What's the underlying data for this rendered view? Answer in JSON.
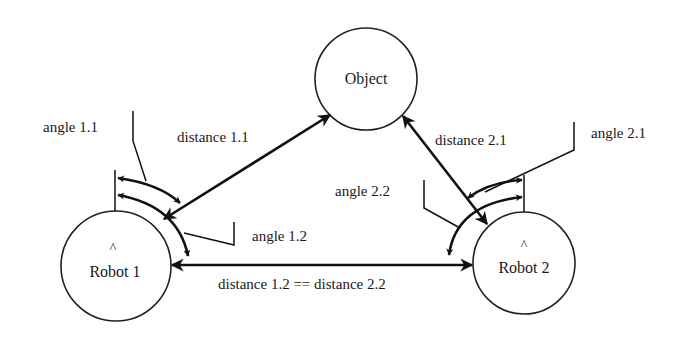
{
  "diagram": {
    "nodes": {
      "object": {
        "label": "Object"
      },
      "robot1": {
        "label": "Robot 1",
        "heading_marker": "^"
      },
      "robot2": {
        "label": "Robot 2",
        "heading_marker": "^"
      }
    },
    "edges": {
      "distance_1_1": {
        "label": "distance 1.1",
        "from": "Robot 1",
        "to": "Object"
      },
      "distance_2_1": {
        "label": "distance 2.1",
        "from": "Robot 2",
        "to": "Object"
      },
      "distance_1_2": {
        "label": "distance 1.2 == distance 2.2",
        "from": "Robot 1",
        "to": "Robot 2"
      }
    },
    "angles": {
      "angle_1_1": {
        "label": "angle 1.1"
      },
      "angle_1_2": {
        "label": "angle 1.2"
      },
      "angle_2_1": {
        "label": "angle 2.1"
      },
      "angle_2_2": {
        "label": "angle 2.2"
      }
    },
    "colors": {
      "stroke": "#111111",
      "background": "#ffffff"
    }
  }
}
